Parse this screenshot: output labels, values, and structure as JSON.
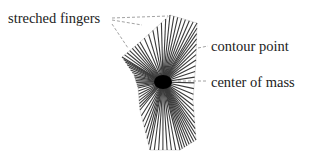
{
  "diagram": {
    "labels": {
      "fingers": "streched fingers",
      "contour": "contour point",
      "center": "center of mass"
    },
    "center": [
      163,
      82
    ],
    "colors": {
      "rays": "#3a3a3a",
      "center": "#000000",
      "leaders": "#888888",
      "contour": "#dddddd"
    }
  }
}
